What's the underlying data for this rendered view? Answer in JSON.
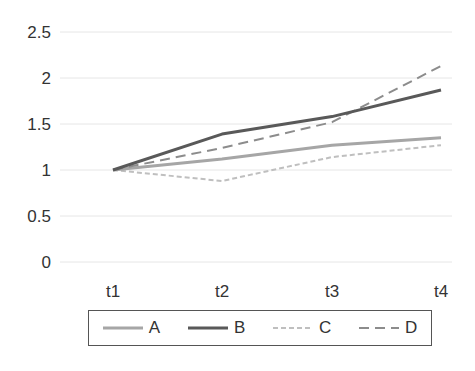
{
  "chart_data": {
    "type": "line",
    "title": "",
    "xlabel": "",
    "ylabel": "",
    "categories": [
      "t1",
      "t2",
      "t3",
      "t4"
    ],
    "ylim": [
      0,
      2.5
    ],
    "yticks": [
      "0",
      "0.5",
      "1",
      "1.5",
      "2",
      "2.5"
    ],
    "grid": true,
    "legend_position": "bottom",
    "series": [
      {
        "name": "A",
        "values": [
          1.0,
          1.12,
          1.27,
          1.35
        ],
        "color": "#a6a6a6",
        "style": "solid",
        "width": 3
      },
      {
        "name": "B",
        "values": [
          1.0,
          1.39,
          1.58,
          1.87
        ],
        "color": "#595959",
        "style": "solid",
        "width": 3
      },
      {
        "name": "C",
        "values": [
          1.0,
          0.88,
          1.14,
          1.27
        ],
        "color": "#bfbfbf",
        "style": "dotted-dash",
        "width": 2
      },
      {
        "name": "D",
        "values": [
          1.0,
          1.24,
          1.52,
          2.13
        ],
        "color": "#8c8c8c",
        "style": "dashed",
        "width": 2
      }
    ]
  },
  "legend": {
    "items": [
      {
        "label": "A"
      },
      {
        "label": "B"
      },
      {
        "label": "C"
      },
      {
        "label": "D"
      }
    ]
  }
}
